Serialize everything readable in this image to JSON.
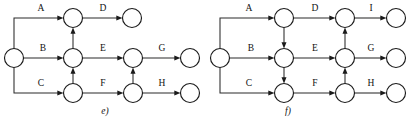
{
  "figure": {
    "type": "diagram",
    "background_color": "#ffffff",
    "line_color": "#2a2a2a",
    "node_fill": "#ffffff",
    "node_stroke": "#1a1a1a",
    "text_color": "#111111"
  },
  "diagrams": [
    {
      "id": "e",
      "caption": "e)",
      "caption_pos": {
        "x": 105,
        "y": 114
      },
      "nodes": [
        {
          "id": "e-source",
          "name": "source-node",
          "cx": 14,
          "cy": 58,
          "r": 9.5
        },
        {
          "id": "e-c1r1",
          "name": "col1-row1-node",
          "cx": 73,
          "cy": 18,
          "r": 9.5
        },
        {
          "id": "e-c1r2",
          "name": "col1-row2-node",
          "cx": 73,
          "cy": 58,
          "r": 9.5
        },
        {
          "id": "e-c1r3",
          "name": "col1-row3-node",
          "cx": 73,
          "cy": 93,
          "r": 9.5
        },
        {
          "id": "e-c2r2",
          "name": "col2-row2-node",
          "cx": 133,
          "cy": 58,
          "r": 9.5
        },
        {
          "id": "e-c2r3",
          "name": "col2-row3-node",
          "cx": 133,
          "cy": 93,
          "r": 9.5
        },
        {
          "id": "e-endD",
          "name": "end-node-d",
          "cx": 132,
          "cy": 18,
          "r": 9.5
        },
        {
          "id": "e-endG",
          "name": "end-node-g",
          "cx": 190,
          "cy": 58,
          "r": 9.5
        },
        {
          "id": "e-endH",
          "name": "end-node-h",
          "cx": 190,
          "cy": 93,
          "r": 9.5
        }
      ],
      "edges": [
        {
          "label": "A",
          "from": "e-source",
          "to": "e-c1r1",
          "label_x": 41,
          "label_y": 11
        },
        {
          "label": "B",
          "from": "e-source",
          "to": "e-c1r2",
          "label_x": 43,
          "label_y": 51
        },
        {
          "label": "C",
          "from": "e-source",
          "to": "e-c1r3",
          "label_x": 41,
          "label_y": 86
        },
        {
          "label": "D",
          "from": "e-c1r1",
          "to": "e-endD",
          "label_x": 103,
          "label_y": 11
        },
        {
          "label": "E",
          "from": "e-c1r2",
          "to": "e-c2r2",
          "label_x": 103,
          "label_y": 51
        },
        {
          "label": "F",
          "from": "e-c1r3",
          "to": "e-c2r3",
          "label_x": 103,
          "label_y": 86
        },
        {
          "label": "G",
          "from": "e-c2r2",
          "to": "e-endG",
          "label_x": 162,
          "label_y": 51
        },
        {
          "label": "H",
          "from": "e-c2r3",
          "to": "e-endH",
          "label_x": 162,
          "label_y": 86
        },
        {
          "label": "",
          "from": "e-c1r2",
          "to": "e-c1r1",
          "dummy": true,
          "direction": "up"
        },
        {
          "label": "",
          "from": "e-c1r3",
          "to": "e-c1r2",
          "dummy": true,
          "direction": "up"
        },
        {
          "label": "",
          "from": "e-c2r3",
          "to": "e-c2r2",
          "dummy": true,
          "direction": "up"
        }
      ]
    },
    {
      "id": "f",
      "caption": "f)",
      "caption_pos": {
        "x": 288,
        "y": 114
      },
      "nodes": [
        {
          "id": "f-source",
          "name": "source-node",
          "cx": 220,
          "cy": 58,
          "r": 9.5
        },
        {
          "id": "f-c1r1",
          "name": "col1-row1-node",
          "cx": 284,
          "cy": 18,
          "r": 9.5
        },
        {
          "id": "f-c1r2",
          "name": "col1-row2-node",
          "cx": 284,
          "cy": 58,
          "r": 9.5
        },
        {
          "id": "f-c1r3",
          "name": "col1-row3-node",
          "cx": 284,
          "cy": 93,
          "r": 9.5
        },
        {
          "id": "f-c2r1",
          "name": "col2-row1-node",
          "cx": 345,
          "cy": 18,
          "r": 9.5
        },
        {
          "id": "f-c2r2",
          "name": "col2-row2-node",
          "cx": 345,
          "cy": 58,
          "r": 9.5
        },
        {
          "id": "f-c2r3",
          "name": "col2-row3-node",
          "cx": 345,
          "cy": 93,
          "r": 9.5
        },
        {
          "id": "f-endI",
          "name": "end-node-i",
          "cx": 396,
          "cy": 18,
          "r": 9.5
        },
        {
          "id": "f-endG",
          "name": "end-node-g",
          "cx": 396,
          "cy": 58,
          "r": 9.5
        },
        {
          "id": "f-endH",
          "name": "end-node-h",
          "cx": 396,
          "cy": 93,
          "r": 9.5
        }
      ],
      "edges": [
        {
          "label": "A",
          "from": "f-source",
          "to": "f-c1r1",
          "label_x": 249,
          "label_y": 11
        },
        {
          "label": "B",
          "from": "f-source",
          "to": "f-c1r2",
          "label_x": 251,
          "label_y": 51
        },
        {
          "label": "C",
          "from": "f-source",
          "to": "f-c1r3",
          "label_x": 249,
          "label_y": 86
        },
        {
          "label": "D",
          "from": "f-c1r1",
          "to": "f-c2r1",
          "label_x": 315,
          "label_y": 11
        },
        {
          "label": "E",
          "from": "f-c1r2",
          "to": "f-c2r2",
          "label_x": 315,
          "label_y": 51
        },
        {
          "label": "F",
          "from": "f-c1r3",
          "to": "f-c2r3",
          "label_x": 315,
          "label_y": 86
        },
        {
          "label": "I",
          "from": "f-c2r1",
          "to": "f-endI",
          "label_x": 371,
          "label_y": 11
        },
        {
          "label": "G",
          "from": "f-c2r2",
          "to": "f-endG",
          "label_x": 371,
          "label_y": 51
        },
        {
          "label": "H",
          "from": "f-c2r3",
          "to": "f-endH",
          "label_x": 371,
          "label_y": 86
        },
        {
          "label": "",
          "from": "f-c1r1",
          "to": "f-c1r2",
          "dummy": true,
          "direction": "down"
        },
        {
          "label": "",
          "from": "f-c1r2",
          "to": "f-c1r3",
          "dummy": true,
          "direction": "down"
        },
        {
          "label": "",
          "from": "f-c2r3",
          "to": "f-c2r2",
          "dummy": true,
          "direction": "up"
        },
        {
          "label": "",
          "from": "f-c2r2",
          "to": "f-c2r1",
          "dummy": true,
          "direction": "up"
        }
      ]
    }
  ]
}
